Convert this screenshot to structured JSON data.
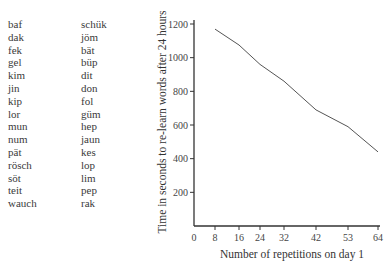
{
  "word_lists": {
    "column1": [
      "baf",
      "dak",
      "fek",
      "gel",
      "kim",
      "jin",
      "kip",
      "lor",
      "mun",
      "num",
      "pät",
      "rösch",
      "söt",
      "teit",
      "wauch"
    ],
    "column2": [
      "schük",
      "jöm",
      "bät",
      "büp",
      "dit",
      "don",
      "fol",
      "güm",
      "hep",
      "jaun",
      "kes",
      "lop",
      "lim",
      "pep",
      "rak"
    ]
  },
  "chart_data": {
    "type": "line",
    "title": "",
    "xlabel": "Number of repetitions on day 1",
    "ylabel": "Time in seconds to re-learn words after 24 hours",
    "x_ticks": [
      0,
      8,
      16,
      24,
      32,
      42,
      53,
      64
    ],
    "y_ticks": [
      200,
      400,
      600,
      800,
      1000,
      1200
    ],
    "xlim": [
      0,
      64
    ],
    "ylim": [
      0,
      1200
    ],
    "grid": false,
    "series": [
      {
        "name": "re-learning time",
        "x": [
          8,
          16,
          24,
          32,
          42,
          53,
          64
        ],
        "values": [
          1170,
          1075,
          960,
          860,
          690,
          590,
          440
        ]
      }
    ]
  },
  "colors": {
    "line": "#555555",
    "axis": "#333333",
    "text": "#3a3a3a"
  }
}
